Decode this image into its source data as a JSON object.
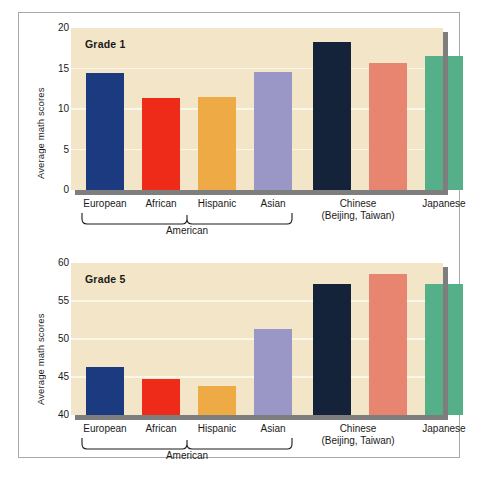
{
  "figure": {
    "ylabel": "Average math scores",
    "group_bracket_label": "American",
    "categories": [
      {
        "label": "European",
        "sub": ""
      },
      {
        "label": "African",
        "sub": ""
      },
      {
        "label": "Hispanic",
        "sub": ""
      },
      {
        "label": "Asian",
        "sub": ""
      },
      {
        "label": "Chinese",
        "sub": "(Beijing, Taiwan)"
      },
      {
        "label": "Japanese",
        "sub": ""
      }
    ],
    "colors": {
      "european": "#1c3a80",
      "african": "#ee2a18",
      "hispanic": "#edaa45",
      "asian": "#9a96c6",
      "chinese": "#14233a",
      "taiwan": "#e88570",
      "japanese": "#55b089",
      "plot_background": "#f3e6c8",
      "gridline": "#fbf6ea",
      "shadow": "#7e7e7e",
      "frame": "#a8a8a8"
    },
    "panels": [
      {
        "title": "Grade 1",
        "yticks": [
          "20",
          "15",
          "10",
          "5",
          "0"
        ],
        "ymin": 0,
        "ymax": 20
      },
      {
        "title": "Grade 5",
        "yticks": [
          "60",
          "55",
          "50",
          "45",
          "40"
        ],
        "ymin": 40,
        "ymax": 60
      }
    ]
  },
  "chart_data": [
    {
      "type": "bar",
      "title": "Grade 1",
      "xlabel": "",
      "ylabel": "Average math scores",
      "categories": [
        "European",
        "African",
        "Hispanic",
        "Asian",
        "Chinese (Beijing, Taiwan)",
        "Japanese"
      ],
      "bar_labels": [
        "European American",
        "African American",
        "Hispanic American",
        "Asian American",
        "Chinese (Beijing)",
        "Chinese (Taiwan)",
        "Japanese"
      ],
      "values": [
        14.4,
        11.3,
        11.5,
        14.6,
        18.3,
        15.7,
        16.5
      ],
      "colors": [
        "#1c3a80",
        "#ee2a18",
        "#edaa45",
        "#9a96c6",
        "#14233a",
        "#e88570",
        "#55b089"
      ],
      "ylim": [
        0,
        20
      ],
      "yticks": [
        0,
        5,
        10,
        15,
        20
      ],
      "grid": true,
      "legend": "none"
    },
    {
      "type": "bar",
      "title": "Grade 5",
      "xlabel": "",
      "ylabel": "Average math scores",
      "categories": [
        "European",
        "African",
        "Hispanic",
        "Asian",
        "Chinese (Beijing, Taiwan)",
        "Japanese"
      ],
      "bar_labels": [
        "European American",
        "African American",
        "Hispanic American",
        "Asian American",
        "Chinese (Beijing)",
        "Chinese (Taiwan)",
        "Japanese"
      ],
      "values": [
        46.3,
        44.8,
        43.8,
        51.3,
        57.2,
        58.6,
        57.3
      ],
      "colors": [
        "#1c3a80",
        "#ee2a18",
        "#edaa45",
        "#9a96c6",
        "#14233a",
        "#e88570",
        "#55b089"
      ],
      "ylim": [
        40,
        60
      ],
      "yticks": [
        40,
        45,
        50,
        55,
        60
      ],
      "grid": true,
      "legend": "none"
    }
  ]
}
